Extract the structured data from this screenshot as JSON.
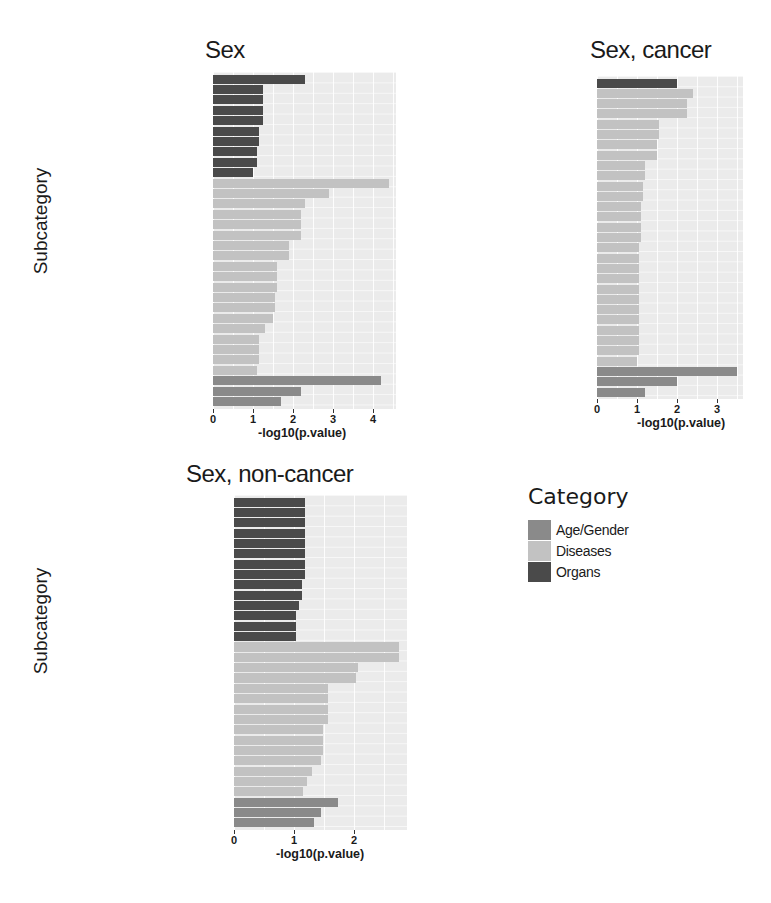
{
  "colors": {
    "Age/Gender": "#8a8a8a",
    "Diseases": "#c2c2c2",
    "Organs": "#4a4a4a",
    "panel_bg": "#ebebeb"
  },
  "legend": {
    "title": "Category",
    "items": [
      {
        "label": "Age/Gender",
        "color": "#8a8a8a"
      },
      {
        "label": "Diseases",
        "color": "#c2c2c2"
      },
      {
        "label": "Organs",
        "color": "#4a4a4a"
      }
    ]
  },
  "chart_data": [
    {
      "type": "bar",
      "orientation": "horizontal",
      "title": "Sex",
      "xlabel": "-log10(p.value)",
      "ylabel": "Subcategory",
      "xlim": [
        0,
        4.6
      ],
      "xticks": [
        "0",
        "1",
        "2",
        "3",
        "4"
      ],
      "grid": true,
      "legend_position": "separate",
      "rows": [
        {
          "label": "Liver",
          "value": 2.3,
          "category": "Organs"
        },
        {
          "label": "Ovary",
          "value": 1.25,
          "category": "Organs"
        },
        {
          "label": "Kidney",
          "value": 1.25,
          "category": "Organs"
        },
        {
          "label": "Cytoskeleton",
          "value": 1.25,
          "category": "Organs"
        },
        {
          "label": "Adipose Tissue",
          "value": 1.25,
          "category": "Organs"
        },
        {
          "label": "Serum",
          "value": 1.15,
          "category": "Organs"
        },
        {
          "label": "Muscle Skeletal",
          "value": 1.15,
          "category": "Organs"
        },
        {
          "label": "Breast",
          "value": 1.1,
          "category": "Organs"
        },
        {
          "label": "Bodily Secretions",
          "value": 1.1,
          "category": "Organs"
        },
        {
          "label": "Bone and Bones",
          "value": 1.0,
          "category": "Organs"
        },
        {
          "label": "Carcinoma Hepatocellular",
          "value": 4.4,
          "category": "Diseases"
        },
        {
          "label": "Carcinoma",
          "value": 2.9,
          "category": "Diseases"
        },
        {
          "label": "Leukemia",
          "value": 2.3,
          "category": "Diseases"
        },
        {
          "label": "Inflammation",
          "value": 2.2,
          "category": "Diseases"
        },
        {
          "label": "Leukemia Myeloid",
          "value": 2.2,
          "category": "Diseases"
        },
        {
          "label": "Choristoma",
          "value": 2.2,
          "category": "Diseases"
        },
        {
          "label": "Paraproteinemias",
          "value": 1.9,
          "category": "Diseases"
        },
        {
          "label": "Mon. Gamm. of Undet. Sign.",
          "value": 1.9,
          "category": "Diseases"
        },
        {
          "label": "Neuroblastoma",
          "value": 1.6,
          "category": "Diseases"
        },
        {
          "label": "Leukemia Myeloid Acute",
          "value": 1.6,
          "category": "Diseases"
        },
        {
          "label": "Adenocarcinoma",
          "value": 1.6,
          "category": "Diseases"
        },
        {
          "label": "Breast Neoplasms",
          "value": 1.55,
          "category": "Diseases"
        },
        {
          "label": "Multiple Myeloma",
          "value": 1.55,
          "category": "Diseases"
        },
        {
          "label": "Asthma",
          "value": 1.5,
          "category": "Diseases"
        },
        {
          "label": "Fibrosis",
          "value": 1.3,
          "category": "Diseases"
        },
        {
          "label": "Hepatitis",
          "value": 1.15,
          "category": "Diseases"
        },
        {
          "label": "Anoxia",
          "value": 1.15,
          "category": "Diseases"
        },
        {
          "label": "Adenoma",
          "value": 1.15,
          "category": "Diseases"
        },
        {
          "label": "Glioblastoma",
          "value": 1.1,
          "category": "Diseases"
        },
        {
          "label": "upregulated in male",
          "value": 4.2,
          "category": "Age/Gender"
        },
        {
          "label": "negatively correlated with age",
          "value": 2.2,
          "category": "Age/Gender"
        },
        {
          "label": "gender dependent",
          "value": 1.7,
          "category": "Age/Gender"
        }
      ]
    },
    {
      "type": "bar",
      "orientation": "horizontal",
      "title": "Sex, cancer",
      "xlabel": "-log10(p.value)",
      "ylabel": "",
      "xlim": [
        0,
        3.65
      ],
      "xticks": [
        "0",
        "1",
        "2",
        "3"
      ],
      "grid": true,
      "rows": [
        {
          "label": "Bone and Bones",
          "value": 2.0,
          "category": "Organs"
        },
        {
          "label": "Cardiovascular Diseases",
          "value": 2.4,
          "category": "Diseases"
        },
        {
          "label": "Leukemia Myeloid",
          "value": 2.25,
          "category": "Diseases"
        },
        {
          "label": "Leukemia",
          "value": 2.25,
          "category": "Diseases"
        },
        {
          "label": "Leukemia Lymphoid",
          "value": 1.55,
          "category": "Diseases"
        },
        {
          "label": "Hemorrhage",
          "value": 1.55,
          "category": "Diseases"
        },
        {
          "label": "Leukemia Myeloid Acute",
          "value": 1.5,
          "category": "Diseases"
        },
        {
          "label": "Inflammation",
          "value": 1.5,
          "category": "Diseases"
        },
        {
          "label": "Neoplasm Metastasis",
          "value": 1.2,
          "category": "Diseases"
        },
        {
          "label": "Lymphoma Mantle-Cell",
          "value": 1.2,
          "category": "Diseases"
        },
        {
          "label": "Lymphoma",
          "value": 1.15,
          "category": "Diseases"
        },
        {
          "label": "Head and neck cancer",
          "value": 1.15,
          "category": "Diseases"
        },
        {
          "label": "Prostatic Neoplasms",
          "value": 1.1,
          "category": "Diseases"
        },
        {
          "label": "Starvation",
          "value": 1.1,
          "category": "Diseases"
        },
        {
          "label": "Paraproteinemias",
          "value": 1.1,
          "category": "Diseases"
        },
        {
          "label": "Mon. Gamm. of Undet. Sign.",
          "value": 1.1,
          "category": "Diseases"
        },
        {
          "label": "Lymphoma B-Cell",
          "value": 1.05,
          "category": "Diseases"
        },
        {
          "label": "Lung Neoplasms",
          "value": 1.05,
          "category": "Diseases"
        },
        {
          "label": "Leukemia Lymphocytic Chronic B-Cell",
          "value": 1.05,
          "category": "Diseases"
        },
        {
          "label": "Ischemia",
          "value": 1.05,
          "category": "Diseases"
        },
        {
          "label": "Infection",
          "value": 1.05,
          "category": "Diseases"
        },
        {
          "label": "Colorectal Neoplasms",
          "value": 1.05,
          "category": "Diseases"
        },
        {
          "label": "Carcinoma Squamous Cell",
          "value": 1.05,
          "category": "Diseases"
        },
        {
          "label": "Carcinoma Hepatocellular",
          "value": 1.05,
          "category": "Diseases"
        },
        {
          "label": "Carcinoma",
          "value": 1.05,
          "category": "Diseases"
        },
        {
          "label": "Adenoma Pleomorphic",
          "value": 1.05,
          "category": "Diseases"
        },
        {
          "label": "Adenoma",
          "value": 1.05,
          "category": "Diseases"
        },
        {
          "label": "Anoxia",
          "value": 1.0,
          "category": "Diseases"
        },
        {
          "label": "upregulated in male",
          "value": 3.5,
          "category": "Age/Gender"
        },
        {
          "label": "negatively correlated with age",
          "value": 2.0,
          "category": "Age/Gender"
        },
        {
          "label": "gender dependent",
          "value": 1.2,
          "category": "Age/Gender"
        }
      ]
    },
    {
      "type": "bar",
      "orientation": "horizontal",
      "title": "Sex, non-cancer",
      "xlabel": "-log10(p.value)",
      "ylabel": "Subcategory",
      "xlim": [
        0,
        2.9
      ],
      "xticks": [
        "0",
        "1",
        "2"
      ],
      "grid": true,
      "rows": [
        {
          "label": "T-Lymphocytes",
          "value": 1.18,
          "category": "Organs"
        },
        {
          "label": "Muscle Skeletal",
          "value": 1.18,
          "category": "Organs"
        },
        {
          "label": "Lung",
          "value": 1.18,
          "category": "Organs"
        },
        {
          "label": "Liver",
          "value": 1.18,
          "category": "Organs"
        },
        {
          "label": "Fibroblasts",
          "value": 1.18,
          "category": "Organs"
        },
        {
          "label": "Endometrium",
          "value": 1.18,
          "category": "Organs"
        },
        {
          "label": "Breast",
          "value": 1.18,
          "category": "Organs"
        },
        {
          "label": "Bodily Secretions",
          "value": 1.18,
          "category": "Organs"
        },
        {
          "label": "Neck",
          "value": 1.13,
          "category": "Organs"
        },
        {
          "label": "Head",
          "value": 1.13,
          "category": "Organs"
        },
        {
          "label": "Membranes",
          "value": 1.08,
          "category": "Organs"
        },
        {
          "label": "Neurons",
          "value": 1.03,
          "category": "Organs"
        },
        {
          "label": "Myoblasts",
          "value": 1.03,
          "category": "Organs"
        },
        {
          "label": "Muscle Cells",
          "value": 1.03,
          "category": "Organs"
        },
        {
          "label": "Lung Neoplasms",
          "value": 2.75,
          "category": "Diseases"
        },
        {
          "label": "Carcinoma Hepatocellular",
          "value": 2.75,
          "category": "Diseases"
        },
        {
          "label": "Carcinoma Non-Small-Cell Lung",
          "value": 2.07,
          "category": "Diseases"
        },
        {
          "label": "Carcinoma",
          "value": 2.03,
          "category": "Diseases"
        },
        {
          "label": "Neuroblastoma",
          "value": 1.57,
          "category": "Diseases"
        },
        {
          "label": "Endometrial Neoplasms",
          "value": 1.57,
          "category": "Diseases"
        },
        {
          "label": "Choristoma",
          "value": 1.57,
          "category": "Diseases"
        },
        {
          "label": "Breast Neoplasms",
          "value": 1.57,
          "category": "Diseases"
        },
        {
          "label": "Stomach Neoplasms",
          "value": 1.48,
          "category": "Diseases"
        },
        {
          "label": "Osteoarthritis",
          "value": 1.48,
          "category": "Diseases"
        },
        {
          "label": "Adenocarcinoma",
          "value": 1.48,
          "category": "Diseases"
        },
        {
          "label": "Liver Neoplasms",
          "value": 1.45,
          "category": "Diseases"
        },
        {
          "label": "Neoplasm Metastasis",
          "value": 1.3,
          "category": "Diseases"
        },
        {
          "label": "Leukemia",
          "value": 1.22,
          "category": "Diseases"
        },
        {
          "label": "Carcinoma Squamous Cell",
          "value": 1.15,
          "category": "Diseases"
        },
        {
          "label": "upregulated in male",
          "value": 1.73,
          "category": "Age/Gender"
        },
        {
          "label": "gender dependent",
          "value": 1.45,
          "category": "Age/Gender"
        },
        {
          "label": "negatively correlated with age",
          "value": 1.33,
          "category": "Age/Gender"
        }
      ]
    }
  ]
}
